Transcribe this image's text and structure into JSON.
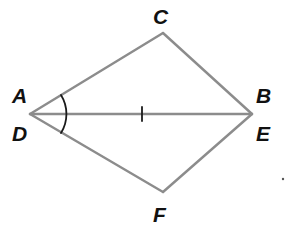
{
  "diagram": {
    "type": "geometry-congruent-triangles",
    "colors": {
      "segment": "#8c8c8c",
      "marks": "#1a1a1a",
      "labels": "#111111",
      "background": "#ffffff"
    },
    "points": {
      "AD": {
        "x": 30,
        "y": 114
      },
      "BE": {
        "x": 252,
        "y": 114
      },
      "C": {
        "x": 163,
        "y": 33
      },
      "F": {
        "x": 163,
        "y": 192
      }
    },
    "labels": [
      {
        "id": "A",
        "text": "A",
        "x": 12,
        "y": 103
      },
      {
        "id": "D",
        "text": "D",
        "x": 12,
        "y": 141
      },
      {
        "id": "C",
        "text": "C",
        "x": 154,
        "y": 23
      },
      {
        "id": "B",
        "text": "B",
        "x": 256,
        "y": 103
      },
      {
        "id": "E",
        "text": "E",
        "x": 256,
        "y": 141
      },
      {
        "id": "F",
        "text": "F",
        "x": 154,
        "y": 222
      }
    ],
    "segments": [
      {
        "name": "segment-AC",
        "from": "AD",
        "to": "C"
      },
      {
        "name": "segment-CB",
        "from": "C",
        "to": "BE"
      },
      {
        "name": "segment-AB-DE",
        "from": "AD",
        "to": "BE"
      },
      {
        "name": "segment-DF",
        "from": "AD",
        "to": "F"
      },
      {
        "name": "segment-FE",
        "from": "F",
        "to": "BE"
      }
    ],
    "markings": {
      "tick_on_shared_side": {
        "x": 142,
        "y1": 108,
        "y2": 120
      },
      "angle_arc_at_A_D": {
        "cx": 30,
        "cy": 114,
        "r": 36
      }
    }
  }
}
